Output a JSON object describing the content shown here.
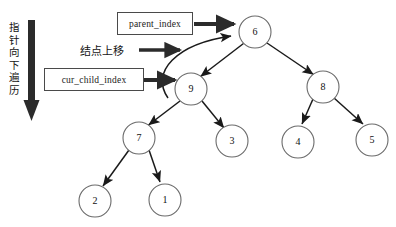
{
  "figure": {
    "background": "#ffffff",
    "width": 396,
    "height": 227
  },
  "annotations": {
    "vertical_traverse_label": "指针向下遍历",
    "node_up_label": "结点上移",
    "parent_index_label": "parent_index",
    "cur_child_index_label": "cur_child_index"
  },
  "colors": {
    "node_stroke": "#6b6b6b",
    "edge_stroke": "#1a1a1a",
    "box_stroke": "#4a4a4a",
    "thick_arrow": "#2b2b2b",
    "text": "#141414"
  },
  "tree": {
    "nodes": [
      {
        "id": "n6",
        "label": "6",
        "cx": 255,
        "cy": 32,
        "r": 16
      },
      {
        "id": "n9",
        "label": "9",
        "cx": 191,
        "cy": 89,
        "r": 16
      },
      {
        "id": "n8",
        "label": "8",
        "cx": 323,
        "cy": 87,
        "r": 16
      },
      {
        "id": "n7",
        "label": "7",
        "cx": 139,
        "cy": 138,
        "r": 16
      },
      {
        "id": "n3",
        "label": "3",
        "cx": 232,
        "cy": 141,
        "r": 16
      },
      {
        "id": "n4",
        "label": "4",
        "cx": 298,
        "cy": 142,
        "r": 16
      },
      {
        "id": "n5",
        "label": "5",
        "cx": 372,
        "cy": 140,
        "r": 16
      },
      {
        "id": "n2",
        "label": "2",
        "cx": 95,
        "cy": 201,
        "r": 16
      },
      {
        "id": "n1",
        "label": "1",
        "cx": 165,
        "cy": 200,
        "r": 16
      }
    ],
    "edges": [
      {
        "from": "n6",
        "to": "n9"
      },
      {
        "from": "n6",
        "to": "n8"
      },
      {
        "from": "n9",
        "to": "n7"
      },
      {
        "from": "n9",
        "to": "n3"
      },
      {
        "from": "n8",
        "to": "n4"
      },
      {
        "from": "n8",
        "to": "n5"
      },
      {
        "from": "n7",
        "to": "n2"
      },
      {
        "from": "n7",
        "to": "n1"
      }
    ]
  }
}
